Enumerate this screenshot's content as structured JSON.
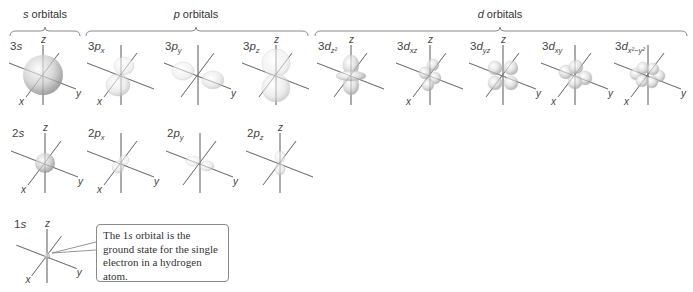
{
  "groups": [
    {
      "id": "s",
      "title_italic": "s",
      "title_rest": " orbitals",
      "x1": 10,
      "x2": 80,
      "label_x": 45
    },
    {
      "id": "p",
      "title_italic": "p",
      "title_rest": " orbitals",
      "x1": 86,
      "x2": 308,
      "label_x": 196
    },
    {
      "id": "d",
      "title_italic": "d",
      "title_rest": " orbitals",
      "x1": 315,
      "x2": 687,
      "label_x": 500
    }
  ],
  "orbitals": [
    {
      "name": "3s",
      "prefix": "3",
      "letter": "s",
      "sub": "",
      "row": 1,
      "cx": 43,
      "cy": 75,
      "shape": "sphere-large",
      "show_x": true,
      "show_y": true,
      "show_z": true
    },
    {
      "name": "3px",
      "prefix": "3",
      "letter": "p",
      "sub": "x",
      "row": 1,
      "cx": 121,
      "cy": 75,
      "shape": "p-x",
      "show_x": true,
      "show_y": false,
      "show_z": false
    },
    {
      "name": "3py",
      "prefix": "3",
      "letter": "p",
      "sub": "y",
      "row": 1,
      "cx": 198,
      "cy": 75,
      "shape": "p-y",
      "show_x": false,
      "show_y": true,
      "show_z": false
    },
    {
      "name": "3pz",
      "prefix": "3",
      "letter": "p",
      "sub": "z",
      "row": 1,
      "cx": 276,
      "cy": 75,
      "shape": "p-z",
      "show_x": false,
      "show_y": false,
      "show_z": true
    },
    {
      "name": "3dz2",
      "prefix": "3",
      "letter": "d",
      "sub": "z²",
      "row": 1,
      "cx": 351,
      "cy": 75,
      "shape": "d-z2",
      "show_x": false,
      "show_y": false,
      "show_z": true
    },
    {
      "name": "3dxz",
      "prefix": "3",
      "letter": "d",
      "sub": "xz",
      "row": 1,
      "cx": 430,
      "cy": 75,
      "shape": "d-xz",
      "show_x": true,
      "show_y": false,
      "show_z": true
    },
    {
      "name": "3dyz",
      "prefix": "3",
      "letter": "d",
      "sub": "yz",
      "row": 1,
      "cx": 503,
      "cy": 75,
      "shape": "d-yz",
      "show_x": false,
      "show_y": true,
      "show_z": true
    },
    {
      "name": "3dxy",
      "prefix": "3",
      "letter": "d",
      "sub": "xy",
      "row": 1,
      "cx": 575,
      "cy": 75,
      "shape": "d-xy",
      "show_x": true,
      "show_y": true,
      "show_z": false
    },
    {
      "name": "3dx2-y2",
      "prefix": "3",
      "letter": "d",
      "sub": "x²−y²",
      "row": 1,
      "cx": 648,
      "cy": 75,
      "shape": "d-x2y2",
      "show_x": true,
      "show_y": true,
      "show_z": false
    },
    {
      "name": "2s",
      "prefix": "2",
      "letter": "s",
      "sub": "",
      "row": 2,
      "cx": 45,
      "cy": 163,
      "shape": "sphere-medium",
      "show_x": true,
      "show_y": true,
      "show_z": true
    },
    {
      "name": "2px",
      "prefix": "2",
      "letter": "p",
      "sub": "x",
      "row": 2,
      "cx": 121,
      "cy": 163,
      "shape": "p-x-small",
      "show_x": true,
      "show_y": true,
      "show_z": false
    },
    {
      "name": "2py",
      "prefix": "2",
      "letter": "p",
      "sub": "y",
      "row": 2,
      "cx": 200,
      "cy": 163,
      "shape": "p-y-small",
      "show_x": false,
      "show_y": true,
      "show_z": false
    },
    {
      "name": "2pz",
      "prefix": "2",
      "letter": "p",
      "sub": "z",
      "row": 2,
      "cx": 280,
      "cy": 163,
      "shape": "p-z-small",
      "show_x": false,
      "show_y": false,
      "show_z": true
    },
    {
      "name": "1s",
      "prefix": "1",
      "letter": "s",
      "sub": "",
      "row": 3,
      "cx": 47,
      "cy": 256,
      "shape": "sphere-small",
      "show_x": true,
      "show_y": true,
      "show_z": true
    }
  ],
  "axis_labels": {
    "x": "x",
    "y": "y",
    "z": "z"
  },
  "callout": {
    "text_before": "The 1",
    "text_italic": "s",
    "text_after": " orbital is the ground state for the single electron in a hydrogen atom."
  },
  "colors": {
    "axis": "#6b6b6b",
    "lobe_light": "#f4f4f4",
    "lobe_mid": "#d9d9d9",
    "lobe_dark": "#a8a8a8",
    "bracket": "#8a8a8a",
    "text": "#333333"
  }
}
